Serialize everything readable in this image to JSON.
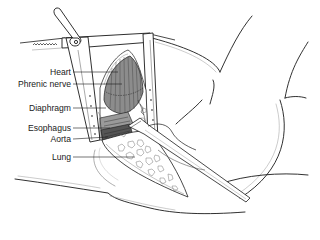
{
  "figure": {
    "labels": [
      {
        "id": "heart",
        "text": "Heart",
        "x": 72,
        "y": 72,
        "target_x": 118
      },
      {
        "id": "phrenic-nerve",
        "text": "Phrenic nerve",
        "x": 72,
        "y": 84,
        "target_x": 122
      },
      {
        "id": "diaphragm",
        "text": "Diaphragm",
        "x": 72,
        "y": 108,
        "target_x": 106
      },
      {
        "id": "esophagus",
        "text": "Esophagus",
        "x": 72,
        "y": 128,
        "target_x": 110
      },
      {
        "id": "aorta",
        "text": "Aorta",
        "x": 72,
        "y": 139,
        "target_x": 108
      },
      {
        "id": "lung",
        "text": "Lung",
        "x": 72,
        "y": 157,
        "target_x": 135
      }
    ],
    "colors": {
      "line": "#1a1a1a",
      "heart_fill": "#8c8c8c",
      "shadow_fill": "#555555",
      "background": "#ffffff"
    }
  }
}
